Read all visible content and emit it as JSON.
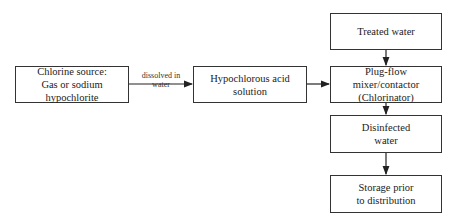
{
  "diagram": {
    "nodes": [
      {
        "id": "chlorine-source",
        "line1": "Chlorine source:",
        "line2": "Gas or sodium hypochlorite"
      },
      {
        "id": "hypochlorous-acid",
        "line1": "Hypochlorous acid",
        "line2": "solution"
      },
      {
        "id": "treated-water",
        "line1": "Treated water",
        "line2": ""
      },
      {
        "id": "plug-flow-mixer",
        "line1": "Plug-flow mixer/contactor",
        "line2": "(Chlorinator)"
      },
      {
        "id": "disinfected-water",
        "line1": "Disinfected",
        "line2": "water"
      },
      {
        "id": "storage",
        "line1": "Storage prior",
        "line2": "to distribution"
      }
    ],
    "edges": [
      {
        "from": "chlorine-source",
        "to": "hypochlorous-acid",
        "label_line1": "dissolved in",
        "label_line2": "water"
      },
      {
        "from": "hypochlorous-acid",
        "to": "plug-flow-mixer",
        "label_line1": "",
        "label_line2": ""
      },
      {
        "from": "treated-water",
        "to": "plug-flow-mixer",
        "label_line1": "",
        "label_line2": ""
      },
      {
        "from": "plug-flow-mixer",
        "to": "disinfected-water",
        "label_line1": "",
        "label_line2": ""
      },
      {
        "from": "disinfected-water",
        "to": "storage",
        "label_line1": "",
        "label_line2": ""
      }
    ]
  }
}
